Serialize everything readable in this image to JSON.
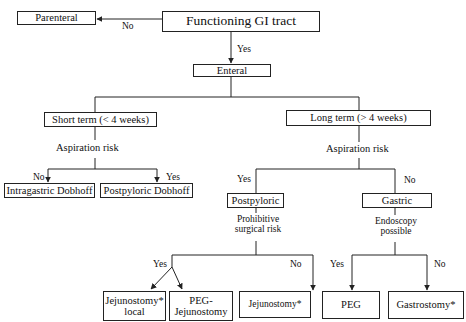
{
  "diagram": {
    "type": "flowchart",
    "nodes": {
      "functioning_gi": "Functioning GI tract",
      "parenteral": "Parenteral",
      "enteral": "Enteral",
      "short_term": "Short term (< 4 weeks)",
      "long_term": "Long term (> 4 weeks)",
      "intragastric_dobhoff": "Intragastric Dobhoff",
      "postpyloric_dobhoff": "Postpyloric Dobhoff",
      "postpyloric": "Postpyloric",
      "gastric": "Gastric",
      "jejunostomy_local_line1": "Jejunostomy*",
      "jejunostomy_local_line2": "local",
      "peg_jejunostomy_line1": "PEG-",
      "peg_jejunostomy_line2": "Jejunostomy",
      "jejunostomy": "Jejunostomy*",
      "peg": "PEG",
      "gastrostomy": "Gastrostomy*"
    },
    "decisions": {
      "aspiration_risk_short": "Aspiration risk",
      "aspiration_risk_long": "Aspiration risk",
      "prohibitive_line1": "Prohibitive",
      "prohibitive_line2": "surgical risk",
      "endoscopy_line1": "Endoscopy",
      "endoscopy_line2": "possible"
    },
    "edge_labels": {
      "gi_no": "No",
      "gi_yes": "Yes",
      "short_no": "No",
      "short_yes": "Yes",
      "long_yes": "Yes",
      "long_no": "No",
      "surgical_yes": "Yes",
      "surgical_no": "No",
      "endo_yes": "Yes",
      "endo_no": "No"
    },
    "edges": [
      {
        "from": "Functioning GI tract",
        "to": "Parenteral",
        "label": "No"
      },
      {
        "from": "Functioning GI tract",
        "to": "Enteral",
        "label": "Yes"
      },
      {
        "from": "Enteral",
        "to": "Short term (< 4 weeks)"
      },
      {
        "from": "Enteral",
        "to": "Long term (> 4 weeks)"
      },
      {
        "from": "Short term (< 4 weeks)",
        "to": "Intragastric Dobhoff",
        "via": "Aspiration risk",
        "label": "No"
      },
      {
        "from": "Short term (< 4 weeks)",
        "to": "Postpyloric Dobhoff",
        "via": "Aspiration risk",
        "label": "Yes"
      },
      {
        "from": "Long term (> 4 weeks)",
        "to": "Postpyloric",
        "via": "Aspiration risk",
        "label": "Yes"
      },
      {
        "from": "Long term (> 4 weeks)",
        "to": "Gastric",
        "via": "Aspiration risk",
        "label": "No"
      },
      {
        "from": "Postpyloric",
        "to": "Jejunostomy* local",
        "via": "Prohibitive surgical risk",
        "label": "Yes"
      },
      {
        "from": "Postpyloric",
        "to": "PEG-Jejunostomy",
        "via": "Prohibitive surgical risk",
        "label": "Yes"
      },
      {
        "from": "Postpyloric",
        "to": "Jejunostomy*",
        "via": "Prohibitive surgical risk",
        "label": "No"
      },
      {
        "from": "Gastric",
        "to": "PEG",
        "via": "Endoscopy possible",
        "label": "Yes"
      },
      {
        "from": "Gastric",
        "to": "Gastrostomy*",
        "via": "Endoscopy possible",
        "label": "No"
      }
    ],
    "colors": {
      "line": "#222222",
      "background": "#ffffff",
      "text": "#111111"
    }
  }
}
